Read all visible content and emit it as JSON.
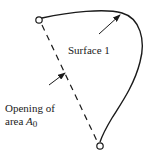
{
  "diagram": {
    "surface_label": "Surface 1",
    "opening_label_line1": "Opening of",
    "opening_label_line2_prefix": "area ",
    "opening_area_symbol": "A",
    "opening_area_subscript": "0",
    "colors": {
      "stroke": "#1a1a1a",
      "background": "#ffffff"
    }
  }
}
